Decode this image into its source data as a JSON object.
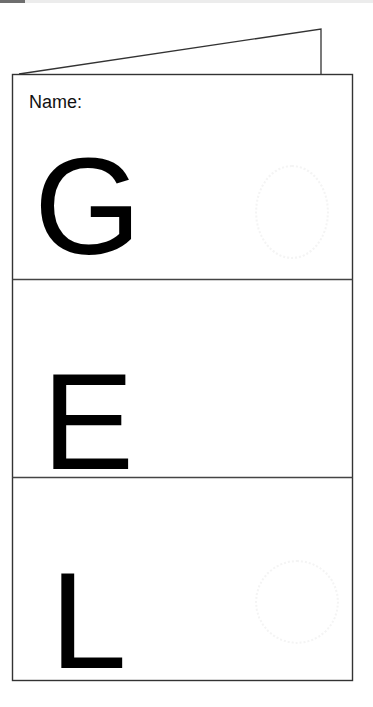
{
  "page": {
    "type": "folded-booklet-worksheet",
    "ink_color": "#000000",
    "line_color": "#333333"
  },
  "cover": {
    "name_label": "Name:"
  },
  "panels": [
    {
      "index": 1,
      "letter": "G"
    },
    {
      "index": 2,
      "letter": "E"
    },
    {
      "index": 3,
      "letter": "L"
    }
  ]
}
